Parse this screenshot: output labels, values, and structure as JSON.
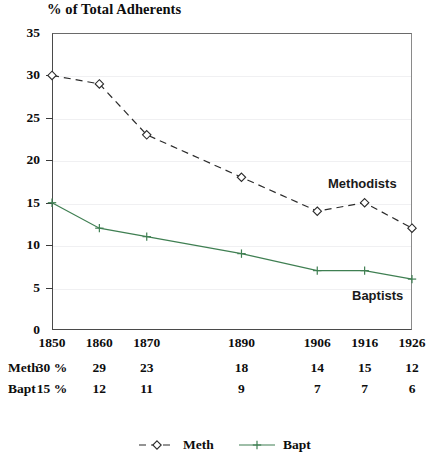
{
  "chart_data": {
    "type": "line",
    "title": "% of Total Adherents",
    "xlabel": "",
    "ylabel": "% of Total Adherents",
    "categories": [
      "1850",
      "1860",
      "1870",
      "1890",
      "1906",
      "1916",
      "1926"
    ],
    "x": [
      1850,
      1860,
      1870,
      1890,
      1906,
      1916,
      1926
    ],
    "xlim": [
      1850,
      1926
    ],
    "ylim": [
      0,
      35
    ],
    "yticks": [
      0,
      5,
      10,
      15,
      20,
      25,
      30,
      35
    ],
    "grid": true,
    "legend_position": "bottom",
    "series": [
      {
        "name": "Meth",
        "label": "Meth",
        "annotation": "Methodists",
        "values": [
          30,
          29,
          23,
          18,
          14,
          15,
          12
        ],
        "color": "#2b2b2b",
        "linestyle": "dashed",
        "marker": "open-diamond"
      },
      {
        "name": "Bapt",
        "label": "Bapt",
        "annotation": "Baptists",
        "values": [
          15,
          12,
          11,
          9,
          7,
          7,
          6
        ],
        "color": "#3f7f52",
        "linestyle": "solid",
        "marker": "plus"
      }
    ],
    "annotations": [
      {
        "text": "Methodists",
        "series": "Meth"
      },
      {
        "text": "Baptists",
        "series": "Bapt"
      }
    ]
  },
  "table": {
    "rows": [
      {
        "label": "Meth",
        "cells": [
          "30 %",
          "29",
          "23",
          "18",
          "14",
          "15",
          "12"
        ]
      },
      {
        "label": "Bapt",
        "cells": [
          "15 %",
          "12",
          "11",
          "9",
          "7",
          "7",
          "6"
        ]
      }
    ]
  },
  "legend": {
    "items": [
      {
        "label": "Meth",
        "color": "#2b2b2b",
        "marker": "open-diamond",
        "linestyle": "dashed"
      },
      {
        "label": "Bapt",
        "color": "#3f7f52",
        "marker": "plus",
        "linestyle": "solid"
      }
    ]
  }
}
